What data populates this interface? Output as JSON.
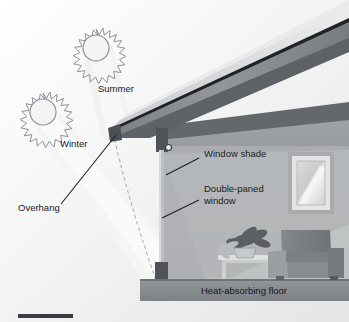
{
  "figure": {
    "type": "passive-solar-house-cross-section",
    "title_visible": false,
    "background_color": "#ffffff"
  },
  "labels": {
    "summer": "Summer",
    "winter": "Winter",
    "overhang": "Overhang",
    "window_shade": "Window shade",
    "double_paned_window": "Double-paned\nwindow",
    "double_paned_window_line1": "Double-paned",
    "double_paned_window_line2": "window",
    "heat_absorbing_floor": "Heat-absorbing floor"
  },
  "elements": {
    "summer_sun": {
      "name": "summer-sun",
      "cx": 96,
      "cy": 48,
      "core_r": 13,
      "ray_r": 19,
      "rays": 18
    },
    "winter_sun": {
      "name": "winter-sun",
      "cx": 43,
      "cy": 112,
      "core_r": 13,
      "ray_r": 19,
      "rays": 18
    },
    "roof": {
      "name": "roof-slab",
      "slope": "low-left-to-high-right"
    },
    "overhang_tip": {
      "x": 112,
      "y": 131
    },
    "post": {
      "name": "support-post",
      "x": 160,
      "top_y": 130,
      "bottom_y": 285
    },
    "shade_roller": {
      "name": "window-shade-roller",
      "cx": 168,
      "cy": 148,
      "r": 2.6
    },
    "armchair": {
      "name": "armchair"
    },
    "side_table": {
      "name": "side-table"
    },
    "potted_plant": {
      "name": "potted-plant"
    },
    "wall_picture": {
      "name": "wall-window-frame"
    },
    "floor_slab": {
      "name": "heat-absorbing-floor-slab",
      "y": 278
    },
    "scale_bar": {
      "name": "scale-bar",
      "x": 18,
      "y": 314,
      "width": 55,
      "height": 4
    }
  },
  "colors": {
    "sun_outline": "#8f9296",
    "sun_fill": "#f2f2f2",
    "summer_beam": "#e9eaeb",
    "winter_beam": "#f2f3f3",
    "interior_light": "#eceded",
    "sky_haze": "#e3e4e5",
    "roof_top": "#d4d6d7",
    "roof_edge": "#23262a",
    "roof_fascia": "#8d9094",
    "roof_under": "#5f6367",
    "ceiling_band": "#636669",
    "back_wall": "#9fa2a5",
    "wall_lower": "#b9bcbe",
    "floor_slab": "#8b8e91",
    "post_dark": "#4e5255",
    "post_shaft": "#b5b8ba",
    "chair": "#7e8286",
    "chair_light": "#a9acae",
    "plant": "#5c6064",
    "table": "#d7d9da",
    "frame_outer": "#a7aaac",
    "frame_inner": "#e8e9ea",
    "leader_line": "#1e2124",
    "dashed_ray": "#9ea1a4",
    "text": "#1a1a1a",
    "scale_bar": "#3a3d40"
  }
}
